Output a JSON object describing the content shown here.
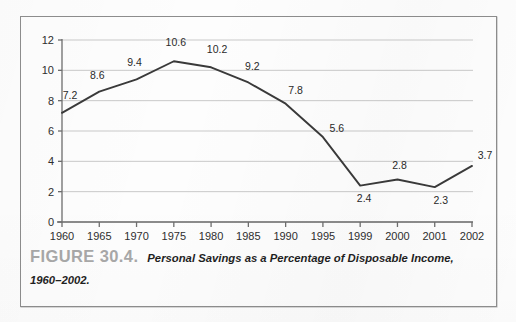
{
  "figure": {
    "number_label": "FIGURE 30.4.",
    "caption_text": "Personal Savings as a Percentage of Disposable Income, 1960–2002.",
    "frame_color": "#8d8d8d",
    "number_color": "#a8a8a8"
  },
  "chart_data": {
    "type": "line",
    "title": "Personal Savings as a Percentage of Disposable Income, 1960–2002",
    "xlabel": "",
    "ylabel": "",
    "categories": [
      "1960",
      "1965",
      "1970",
      "1975",
      "1980",
      "1985",
      "1990",
      "1995",
      "1999",
      "2000",
      "2001",
      "2002"
    ],
    "values": [
      7.2,
      8.6,
      9.4,
      10.6,
      10.2,
      9.2,
      7.8,
      5.6,
      2.4,
      2.8,
      2.3,
      3.7
    ],
    "point_labels": [
      "7.2",
      "8.6",
      "9.4",
      "10.6",
      "10.2",
      "9.2",
      "7.8",
      "5.6",
      "2.4",
      "2.8",
      "2.3",
      "3.7"
    ],
    "ylim": [
      0,
      12
    ],
    "y_ticks": [
      0,
      2,
      4,
      6,
      8,
      10,
      12
    ],
    "y_tick_labels": [
      "0",
      "2",
      "4",
      "6",
      "8",
      "10",
      "12"
    ],
    "grid": true,
    "grid_axis": "y",
    "grid_color": "#c9c9c9",
    "line_color": "#3a3a3a",
    "legend": false,
    "markers": false,
    "label_offsets": [
      {
        "dx": 8,
        "dy": -18
      },
      {
        "dx": -2,
        "dy": -17
      },
      {
        "dx": -2,
        "dy": -17
      },
      {
        "dx": 2,
        "dy": -19
      },
      {
        "dx": 6,
        "dy": -18
      },
      {
        "dx": 4,
        "dy": -16
      },
      {
        "dx": 10,
        "dy": -14
      },
      {
        "dx": 14,
        "dy": -9
      },
      {
        "dx": 4,
        "dy": 12
      },
      {
        "dx": 2,
        "dy": -15
      },
      {
        "dx": 6,
        "dy": 13
      },
      {
        "dx": 13,
        "dy": -11
      }
    ]
  }
}
